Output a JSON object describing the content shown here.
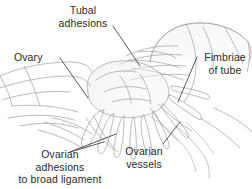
{
  "figure": {
    "background_color": "#ffffff",
    "line_color": "#a9a9a9",
    "text_color": "#2b2b2b",
    "width": 252,
    "height": 189
  },
  "labels": {
    "tubal_adhesions": {
      "line1": "Tubal",
      "line2": "adhesions"
    },
    "ovary": {
      "line1": "Ovary"
    },
    "fimbriae_of_tube": {
      "line1": "Fimbriae",
      "line2": "of tube"
    },
    "ovarian_adhesions_to_broad_ligament": {
      "line1": "Ovarian",
      "line2": "adhesions",
      "line3": "to broad ligament"
    },
    "ovarian_vessels": {
      "line1": "Ovarian",
      "line2": "vessels"
    }
  }
}
